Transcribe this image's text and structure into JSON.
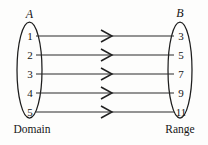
{
  "diagram": {
    "type": "mapping-diagram",
    "title": "",
    "domain_set": {
      "name": "A",
      "caption": "Domain",
      "elements": [
        "1",
        "2",
        "3",
        "4",
        "5"
      ]
    },
    "range_set": {
      "name": "B",
      "caption": "Range",
      "elements": [
        "3",
        "5",
        "7",
        "9",
        "11"
      ]
    },
    "mappings": [
      {
        "from": "1",
        "to": "3"
      },
      {
        "from": "2",
        "to": "5"
      },
      {
        "from": "3",
        "to": "7"
      },
      {
        "from": "4",
        "to": "9"
      },
      {
        "from": "5",
        "to": "11"
      }
    ],
    "arrow_icon": "chevron-right-icon",
    "colors": {
      "background": "#fdfdfc",
      "stroke": "#1d1d1d",
      "line": "#2a2a2a",
      "text": "#151515"
    }
  }
}
